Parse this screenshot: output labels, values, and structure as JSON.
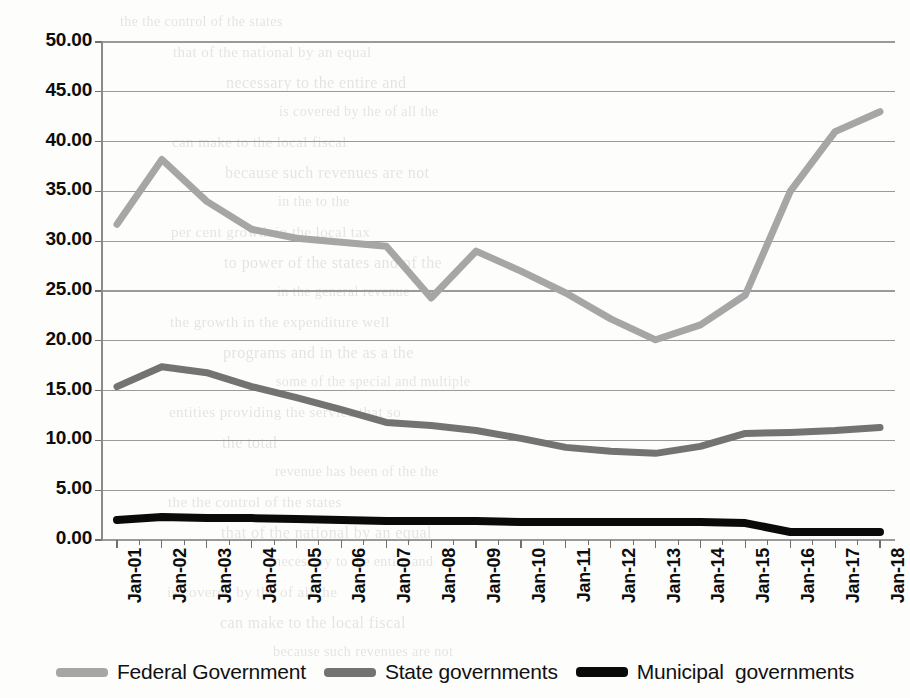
{
  "chart_data": {
    "type": "line",
    "title": "",
    "xlabel": "",
    "ylabel": "",
    "ylim": [
      0,
      50
    ],
    "ytick_step": 5,
    "grid": true,
    "legend_position": "bottom",
    "categories": [
      "Jan-01",
      "Jan-02",
      "Jan-03",
      "Jan-04",
      "Jan-05",
      "Jan-06",
      "Jan-07",
      "Jan-08",
      "Jan-09",
      "Jan-10",
      "Jan-11",
      "Jan-12",
      "Jan-13",
      "Jan-14",
      "Jan-15",
      "Jan-16",
      "Jan-17",
      "Jan-18"
    ],
    "ytick_labels": [
      "0.00",
      "5.00",
      "10.00",
      "15.00",
      "20.00",
      "25.00",
      "30.00",
      "35.00",
      "40.00",
      "45.00",
      "50.00"
    ],
    "series": [
      {
        "name": "Federal Government",
        "color": "#a6a6a6",
        "width": 7,
        "values": [
          31.7,
          38.2,
          34.0,
          31.2,
          30.3,
          29.9,
          29.5,
          24.3,
          29.0,
          27.0,
          24.8,
          22.2,
          20.1,
          21.6,
          24.6,
          35.0,
          41.0,
          43.0
        ]
      },
      {
        "name": "State governments",
        "color": "#737373",
        "width": 7,
        "values": [
          15.4,
          17.4,
          16.8,
          15.4,
          14.3,
          13.1,
          11.8,
          11.5,
          11.0,
          10.2,
          9.3,
          8.9,
          8.7,
          9.4,
          10.7,
          10.8,
          11.0,
          11.3
        ]
      },
      {
        "name": "Municipal  governments",
        "color": "#0a0a0a",
        "width": 8,
        "values": [
          2.0,
          2.3,
          2.2,
          2.2,
          2.1,
          2.0,
          1.9,
          1.9,
          1.9,
          1.8,
          1.8,
          1.8,
          1.8,
          1.8,
          1.7,
          0.8,
          0.8,
          0.8
        ]
      }
    ]
  },
  "axes": {
    "y_axis_color": "#8a8a8a",
    "gridline_color": "#9a9a9a",
    "tick_color": "#6f6f6f"
  },
  "background_text": {
    "lines": [
      "the the control of the states",
      "that of the national by an equal",
      "necessary to the entire and",
      "is covered by the of all the",
      "can make to the local fiscal",
      "because such revenues are not",
      "in the to the",
      "per cent growth in the local tax",
      "to power of the states and of the",
      "in the general revenue",
      "the growth in the expenditure well",
      "programs and in the as a the",
      "some of the special and multiple",
      "entities providing the service that so",
      "the total",
      "revenue has been of the the"
    ]
  }
}
